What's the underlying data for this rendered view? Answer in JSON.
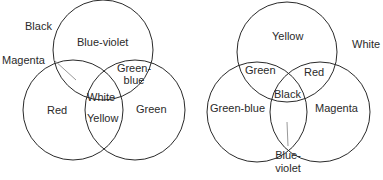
{
  "diagrams": [
    {
      "name": "additive-color-mixing",
      "circles": [
        {
          "id": "top",
          "cx": 103,
          "cy": 50,
          "r": 50
        },
        {
          "id": "left",
          "cx": 73,
          "cy": 110,
          "r": 50
        },
        {
          "id": "right",
          "cx": 135,
          "cy": 110,
          "r": 50
        }
      ],
      "labels": {
        "outside": "Black",
        "pointer": "Magenta",
        "top": "Blue-violet",
        "top_right_1": "Green-",
        "top_right_2": "blue",
        "center": "White",
        "left": "Red",
        "bottom_center": "Yellow",
        "right": "Green"
      }
    },
    {
      "name": "subtractive-color-mixing",
      "circles": [
        {
          "id": "top",
          "cx": 287,
          "cy": 52,
          "r": 50
        },
        {
          "id": "left",
          "cx": 257,
          "cy": 112,
          "r": 50
        },
        {
          "id": "right",
          "cx": 320,
          "cy": 112,
          "r": 50
        }
      ],
      "labels": {
        "outside": "White",
        "top": "Yellow",
        "top_left": "Green",
        "top_right": "Red",
        "center": "Black",
        "left": "Green-blue",
        "right": "Magenta",
        "pointer_1": "Blue-",
        "pointer_2": "violet"
      }
    }
  ],
  "colors": {
    "stroke": "#2a2a2a",
    "pointer": "#999999"
  }
}
